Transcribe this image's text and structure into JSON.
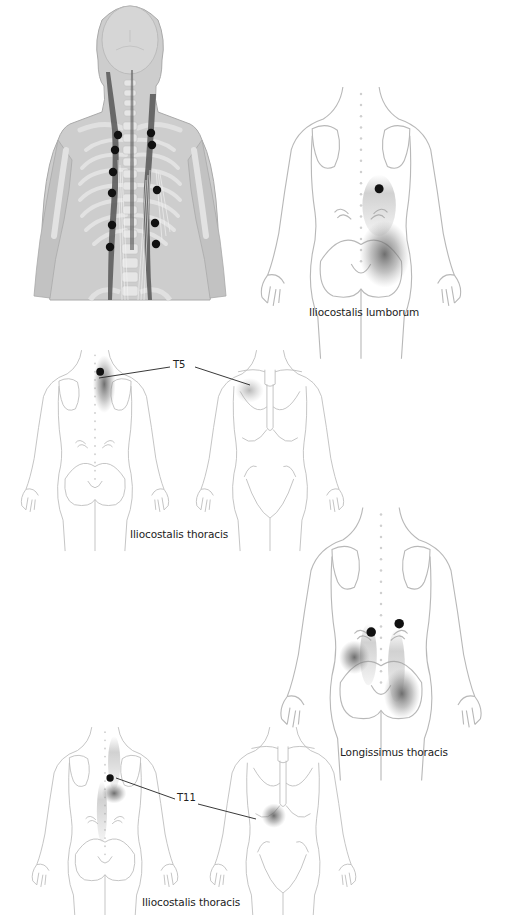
{
  "figures": [
    {
      "id": "anatomy",
      "description": "Posterior view of skeleton with erector spinae muscles and trigger points",
      "trigger_point_count": 11
    },
    {
      "id": "iliocostalis-lumborum",
      "caption": "Iliocostalis lumborum",
      "view": "posterior"
    },
    {
      "id": "iliocostalis-thoracis-t5",
      "caption": "Iliocostalis thoracis",
      "level_label": "T5",
      "views": [
        "posterior",
        "anterior"
      ]
    },
    {
      "id": "longissimus-thoracis",
      "caption": "Longissimus thoracis",
      "view": "posterior"
    },
    {
      "id": "iliocostalis-thoracis-t11",
      "caption": "Iliocostalis thoracis",
      "level_label": "T11",
      "views": [
        "posterior",
        "anterior"
      ]
    }
  ],
  "colors": {
    "outline": "#b8b8b8",
    "trigger_point": "#111111",
    "referral_zone": "#555555",
    "anatomy_fill": "#c8c8c8",
    "muscle": "#5a5a5a"
  }
}
